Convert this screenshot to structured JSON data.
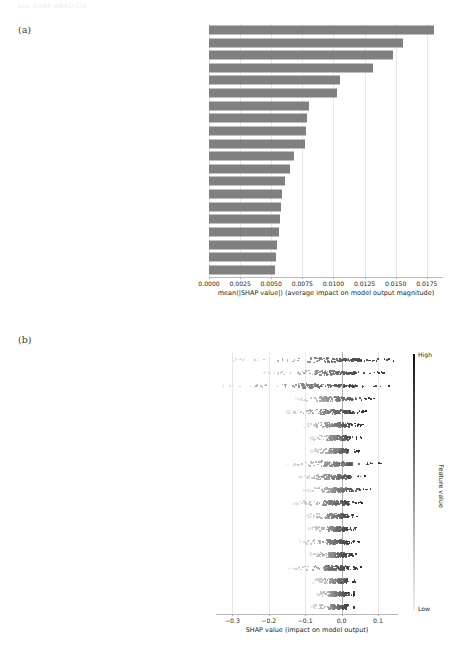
{
  "page_header": "xxx    SHAP ANALYSIS",
  "panels": {
    "a": {
      "label": "(a)"
    },
    "b": {
      "label": "(b)"
    }
  },
  "features": [
    "Pons white matter",
    "Left parahippocampal gyrus",
    "Left lateral ventricle cerebral spinal fluid",
    "Right parahippocampal gyrus",
    "Left cuneus",
    "Right posterior cingulate gyrus",
    "Left superior temporal gyrus",
    "Left inferior parietal lobule",
    "Right lobule viii of cerebellar hemisphere",
    "Left hippocampus",
    "Left supplementary motor area",
    "Right crus i of cerebellar hemisphere",
    "Right fusiform gyrus",
    "Left middle frontal gyrus, orbital part",
    "Left lingual gyrus",
    "Left middle frontal gyrus, lateral part",
    "Left lobule iii of cerebellar hemisphere",
    "Right middle occipital",
    "Right anterior cingulate gyrus",
    "Cerebellum hemisphere white matter left"
  ],
  "colorbar": {
    "high_label": "High",
    "low_label": "Low",
    "title": "Feature value",
    "high_color": "#101010",
    "low_color": "#ececec"
  },
  "chart_data": [
    {
      "type": "bar",
      "panel": "a",
      "orientation": "horizontal",
      "title": "",
      "xlabel": "mean(|SHAP value|) (average impact on model output magnitude)",
      "ylabel": "",
      "xlim": [
        0.0,
        0.0188
      ],
      "xticks": [
        0.0,
        0.0025,
        0.005,
        0.0075,
        0.01,
        0.0125,
        0.015,
        0.0175
      ],
      "xticklabels": [
        "0.0000",
        "0.0025",
        "0.0050",
        "0.0075",
        "0.0100",
        "0.0125",
        "0.0150",
        "0.0175"
      ],
      "grid": true,
      "bar_color": "#808080",
      "categories": [
        "Pons white matter",
        "Left parahippocampal gyrus",
        "Left lateral ventricle cerebral spinal fluid",
        "Right parahippocampal gyrus",
        "Left cuneus",
        "Right posterior cingulate gyrus",
        "Left superior temporal gyrus",
        "Left inferior parietal lobule",
        "Right lobule viii of cerebellar hemisphere",
        "Left hippocampus",
        "Left supplementary motor area",
        "Right crus i of cerebellar hemisphere",
        "Right fusiform gyrus",
        "Left middle frontal gyrus, orbital part",
        "Left lingual gyrus",
        "Left middle frontal gyrus, lateral part",
        "Left lobule iii of cerebellar hemisphere",
        "Right middle occipital",
        "Right anterior cingulate gyrus",
        "Cerebellum hemisphere white matter left"
      ],
      "values": [
        0.0181,
        0.0156,
        0.0148,
        0.0132,
        0.0105,
        0.0103,
        0.008,
        0.0079,
        0.0078,
        0.0077,
        0.0068,
        0.0065,
        0.0061,
        0.0059,
        0.0058,
        0.0057,
        0.0056,
        0.0055,
        0.0054,
        0.0053
      ]
    },
    {
      "type": "scatter",
      "subtype": "beeswarm",
      "panel": "b",
      "title": "",
      "xlabel": "SHAP value (impact on model output)",
      "ylabel": "",
      "xlim": [
        -0.345,
        0.155
      ],
      "xticks": [
        -0.3,
        -0.2,
        -0.1,
        0.0,
        0.1
      ],
      "xticklabels": [
        "−0.3",
        "−0.2",
        "−0.1",
        "0.0",
        "0.1"
      ],
      "grid": true,
      "zero_line": 0.0,
      "colormap": "grayscale",
      "legend_position": "right",
      "categories": [
        "Pons white matter",
        "Left parahippocampal gyrus",
        "Left lateral ventricle cerebral spinal fluid",
        "Right parahippocampal gyrus",
        "Left cuneus",
        "Right posterior cingulate gyrus",
        "Left superior temporal gyrus",
        "Left inferior parietal lobule",
        "Right lobule viii of cerebellar hemisphere",
        "Left hippocampus",
        "Left supplementary motor area",
        "Right crus i of cerebellar hemisphere",
        "Right fusiform gyrus",
        "Left middle frontal gyrus, orbital part",
        "Left lingual gyrus",
        "Left middle frontal gyrus, lateral part",
        "Left lobule iii of cerebellar hemisphere",
        "Right middle occipital",
        "Right anterior cingulate gyrus",
        "Cerebellum hemisphere white matter left"
      ],
      "row_spread": [
        {
          "min": -0.3,
          "max": 0.145,
          "dense_min": -0.075,
          "dense_max": 0.055,
          "n": 150
        },
        {
          "min": -0.215,
          "max": 0.12,
          "dense_min": -0.075,
          "dense_max": 0.04,
          "n": 150
        },
        {
          "min": -0.335,
          "max": 0.13,
          "dense_min": -0.12,
          "dense_max": 0.035,
          "n": 150
        },
        {
          "min": -0.13,
          "max": 0.095,
          "dense_min": -0.06,
          "dense_max": 0.03,
          "n": 150
        },
        {
          "min": -0.16,
          "max": 0.075,
          "dense_min": -0.06,
          "dense_max": 0.025,
          "n": 150
        },
        {
          "min": -0.105,
          "max": 0.06,
          "dense_min": -0.045,
          "dense_max": 0.022,
          "n": 150
        },
        {
          "min": -0.09,
          "max": 0.055,
          "dense_min": -0.04,
          "dense_max": 0.02,
          "n": 150
        },
        {
          "min": -0.085,
          "max": 0.05,
          "dense_min": -0.035,
          "dense_max": 0.018,
          "n": 150
        },
        {
          "min": -0.15,
          "max": 0.11,
          "dense_min": -0.055,
          "dense_max": 0.03,
          "n": 150
        },
        {
          "min": -0.12,
          "max": 0.07,
          "dense_min": -0.05,
          "dense_max": 0.025,
          "n": 150
        },
        {
          "min": -0.105,
          "max": 0.085,
          "dense_min": -0.042,
          "dense_max": 0.028,
          "n": 150
        },
        {
          "min": -0.135,
          "max": 0.06,
          "dense_min": -0.05,
          "dense_max": 0.022,
          "n": 150
        },
        {
          "min": -0.1,
          "max": 0.05,
          "dense_min": -0.04,
          "dense_max": 0.018,
          "n": 150
        },
        {
          "min": -0.095,
          "max": 0.045,
          "dense_min": -0.038,
          "dense_max": 0.016,
          "n": 150
        },
        {
          "min": -0.115,
          "max": 0.048,
          "dense_min": -0.042,
          "dense_max": 0.018,
          "n": 150
        },
        {
          "min": -0.09,
          "max": 0.042,
          "dense_min": -0.035,
          "dense_max": 0.015,
          "n": 150
        },
        {
          "min": -0.145,
          "max": 0.055,
          "dense_min": -0.05,
          "dense_max": 0.02,
          "n": 150
        },
        {
          "min": -0.08,
          "max": 0.045,
          "dense_min": -0.032,
          "dense_max": 0.016,
          "n": 150
        },
        {
          "min": -0.075,
          "max": 0.04,
          "dense_min": -0.03,
          "dense_max": 0.015,
          "n": 150
        },
        {
          "min": -0.085,
          "max": 0.042,
          "dense_min": -0.033,
          "dense_max": 0.016,
          "n": 150
        }
      ]
    }
  ]
}
